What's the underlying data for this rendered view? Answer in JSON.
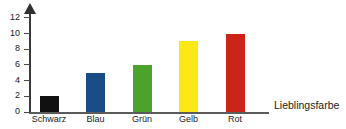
{
  "chart_data": {
    "type": "bar",
    "title": "",
    "subtitle": "",
    "xlabel": "Lieblingsfarbe",
    "ylabel": "",
    "categories": [
      "Schwarz",
      "Blau",
      "Grün",
      "Gelb",
      "Rot"
    ],
    "values": [
      2,
      5,
      6,
      9,
      10
    ],
    "series": [
      {
        "name": "Anzahl",
        "values": [
          2,
          5,
          6,
          9,
          10
        ]
      }
    ],
    "bar_colors": [
      "#111111",
      "#1a4d85",
      "#4ca32b",
      "#fde816",
      "#cc2418"
    ],
    "ylim": [
      0,
      13
    ],
    "yticks": [
      0,
      2,
      4,
      6,
      8,
      10,
      12
    ],
    "ytick_labels": [
      "0",
      "2",
      "4",
      "6",
      "8",
      "10",
      "12"
    ],
    "xtick_labels": [
      "Schwarz",
      "Blau",
      "Grün",
      "Gelb",
      "Rot"
    ],
    "grid": false,
    "legend": false,
    "legend_position": "none",
    "y_axis_arrow": true,
    "axis_color": "#4a4a4a",
    "background": "#ffffff"
  }
}
